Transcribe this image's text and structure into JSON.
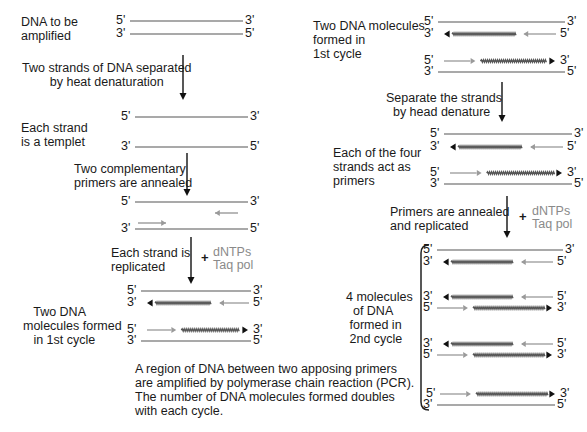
{
  "colors": {
    "strand": "#8c8c8c",
    "new_strand": "#555555",
    "primer": "#9a9a9a",
    "arrowhead_dark": "#111111",
    "text": "#1a1a1a",
    "reagent": "#8a8a8a"
  },
  "left": {
    "start_label": "DNA to be\namplified",
    "step1_label": "Two strands of DNA separated\n        by heat denaturation",
    "templet_label": "Each strand\nis a templet",
    "step2_label": "Two complementary\nprimers are annealed",
    "step3_label": "Each strand is\nreplicated",
    "result_label": "   Two DNA\nmolecules formed\n   in 1st cycle",
    "reagents": {
      "plus": "+",
      "line1": "dNTPs",
      "line2": "Taq pol"
    }
  },
  "right": {
    "start_label": "Two DNA molecules\nformed in\n1st cycle",
    "step1_label": "Separate the strands\n  by head denature",
    "primers_label": "Each of the four\nstrands act as\nprimers",
    "step2_label": "Primers are annealed\nand replicated",
    "result_label": "4 molecules\n  of DNA\n formed in\n 2nd cycle",
    "reagents": {
      "plus": "+",
      "line1": "dNTPs",
      "line2": "Taq pol"
    }
  },
  "caption": "A region of DNA between two apposing primers\nare amplified by polymerase chain reaction (PCR).\nThe number of DNA molecules formed doubles\nwith each cycle.",
  "end_labels": {
    "five": "5'",
    "three": "3'"
  },
  "strands": [
    {
      "x1": 130,
      "x2": 243,
      "y": 21,
      "type": "plain",
      "left": "5'",
      "right": "3'"
    },
    {
      "x1": 130,
      "x2": 243,
      "y": 34,
      "type": "plain",
      "left": "3'",
      "right": "5'"
    },
    {
      "x1": 135,
      "x2": 248,
      "y": 117,
      "type": "plain",
      "left": "5'",
      "right": "3'"
    },
    {
      "x1": 135,
      "x2": 248,
      "y": 147,
      "type": "plain",
      "left": "3'",
      "right": "5'"
    },
    {
      "x1": 135,
      "x2": 248,
      "y": 202,
      "type": "plain",
      "left": "5'",
      "right": "3'"
    },
    {
      "x1": 135,
      "x2": 248,
      "y": 229,
      "type": "plain",
      "left": "3'",
      "right": "5'"
    },
    {
      "x1": 141,
      "x2": 251,
      "y": 291,
      "type": "plain",
      "left": "5'",
      "right": "3'"
    },
    {
      "x1": 141,
      "x2": 251,
      "y": 303,
      "type": "new_left",
      "left": "3'",
      "right": "5'"
    },
    {
      "x1": 141,
      "x2": 251,
      "y": 330,
      "type": "new_right",
      "left": "5'",
      "right": "3'"
    },
    {
      "x1": 141,
      "x2": 251,
      "y": 341,
      "type": "plain",
      "left": "3'",
      "right": "5'"
    },
    {
      "x1": 438,
      "x2": 565,
      "y": 22,
      "type": "plain",
      "left": "5'",
      "right": "3'"
    },
    {
      "x1": 438,
      "x2": 558,
      "y": 34,
      "type": "new_left",
      "left": "3'",
      "right": "5'"
    },
    {
      "x1": 438,
      "x2": 558,
      "y": 61,
      "type": "new_right",
      "left": "5'",
      "right": "3'"
    },
    {
      "x1": 438,
      "x2": 565,
      "y": 72,
      "type": "plain",
      "left": "3'",
      "right": "5'"
    },
    {
      "x1": 444,
      "x2": 572,
      "y": 134,
      "type": "plain",
      "left": "5'",
      "right": "3'"
    },
    {
      "x1": 444,
      "x2": 565,
      "y": 147,
      "type": "new_left",
      "left": "3'",
      "right": "5'"
    },
    {
      "x1": 444,
      "x2": 565,
      "y": 173,
      "type": "new_right",
      "left": "5'",
      "right": "3'"
    },
    {
      "x1": 444,
      "x2": 572,
      "y": 184,
      "type": "plain",
      "left": "3'",
      "right": "5'"
    },
    {
      "x1": 437,
      "x2": 563,
      "y": 250,
      "type": "plain",
      "left": "5'",
      "right": "3'"
    },
    {
      "x1": 437,
      "x2": 555,
      "y": 262,
      "type": "new_left",
      "left": "3'",
      "right": "5'"
    },
    {
      "x1": 437,
      "x2": 555,
      "y": 297,
      "type": "new_left",
      "left": "3'",
      "right": "5'"
    },
    {
      "x1": 437,
      "x2": 555,
      "y": 308,
      "type": "new_right2",
      "left": "5'",
      "right": "3'"
    },
    {
      "x1": 437,
      "x2": 555,
      "y": 344,
      "type": "new_left",
      "left": "3'",
      "right": "5'"
    },
    {
      "x1": 437,
      "x2": 555,
      "y": 355,
      "type": "new_right2",
      "left": "5'",
      "right": "3'"
    },
    {
      "x1": 440,
      "x2": 558,
      "y": 394,
      "type": "new_right2",
      "left": "5'",
      "right": "3'"
    },
    {
      "x1": 437,
      "x2": 555,
      "y": 405,
      "type": "plain",
      "left": "3'",
      "right": "5'"
    }
  ],
  "primers": [
    {
      "x1": 238,
      "x2": 215,
      "y": 213
    },
    {
      "x1": 138,
      "x2": 166,
      "y": 223
    }
  ],
  "arrows": [
    {
      "x": 183,
      "y1": 55,
      "y2": 100
    },
    {
      "x": 187,
      "y1": 153,
      "y2": 196
    },
    {
      "x": 191,
      "y1": 237,
      "y2": 284
    },
    {
      "x": 502,
      "y1": 82,
      "y2": 122
    },
    {
      "x": 507,
      "y1": 196,
      "y2": 238
    }
  ],
  "bracket": {
    "x": 421,
    "y1": 245,
    "y2": 410
  }
}
